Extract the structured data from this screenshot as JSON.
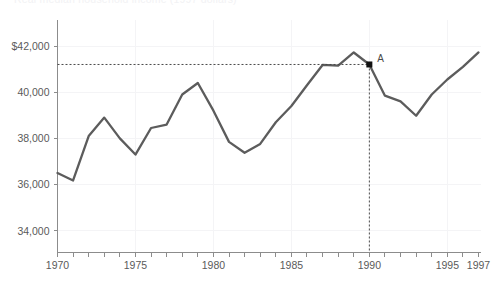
{
  "title": {
    "text_clipped": "Real median household income (1997 dollars)"
  },
  "chart_data": {
    "type": "line",
    "title": "",
    "xlabel": "",
    "ylabel": "",
    "xlim": [
      1970,
      1997
    ],
    "ylim": [
      32800,
      42700
    ],
    "grid": true,
    "legend": "none",
    "x": [
      1970,
      1971,
      1972,
      1973,
      1974,
      1975,
      1976,
      1977,
      1978,
      1979,
      1980,
      1981,
      1982,
      1983,
      1984,
      1985,
      1986,
      1987,
      1988,
      1989,
      1990,
      1991,
      1992,
      1993,
      1994,
      1995,
      1996,
      1997
    ],
    "values": [
      36500,
      36180,
      38100,
      38900,
      38000,
      37300,
      38450,
      38600,
      39900,
      40400,
      39200,
      37850,
      37380,
      37760,
      38700,
      39400,
      40300,
      41180,
      41150,
      41720,
      41200,
      39850,
      39600,
      38980,
      39900,
      40550,
      41100,
      41720
    ],
    "series": [
      {
        "name": "median household income",
        "color": "#5c5c5c",
        "values": [
          36500,
          36180,
          38100,
          38900,
          38000,
          37300,
          38450,
          38600,
          39900,
          40400,
          39200,
          37850,
          37380,
          37760,
          38700,
          39400,
          40300,
          41180,
          41150,
          41720,
          41200,
          39850,
          39600,
          38980,
          39900,
          40550,
          41100,
          41720
        ]
      }
    ],
    "ytick_values": [
      34000,
      36000,
      38000,
      40000,
      42000
    ],
    "ytick_labels": [
      "34,000",
      "36,000",
      "38,000",
      "40,000",
      "$42,000"
    ],
    "xtick_values": [
      1970,
      1975,
      1980,
      1985,
      1990,
      1995,
      1997
    ],
    "xtick_labels": [
      "1970",
      "1975",
      "1980",
      "1985",
      "1990",
      "1995",
      "1997"
    ],
    "xtick_minor_step": 1,
    "annotations": [
      {
        "label": "A",
        "x": 1990,
        "y": 41200,
        "marker": "square-dot",
        "guide_horizontal": true,
        "guide_vertical": true
      }
    ]
  },
  "colors": {
    "line": "#5c5c5c",
    "axis": "#8c8c8c",
    "grid": "#f4f4f6",
    "text": "#5a5a5a",
    "marker": "#111111",
    "background": "#ffffff"
  }
}
